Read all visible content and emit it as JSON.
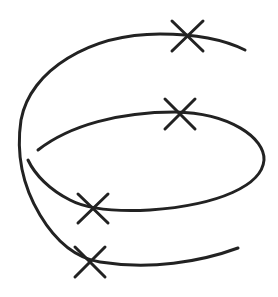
{
  "diagram": {
    "stroke_color": "#222222",
    "background": "#ffffff",
    "markers": [
      {
        "name": "marker-top-outer",
        "x": 187,
        "y": 35
      },
      {
        "name": "marker-top-inner",
        "x": 180,
        "y": 113
      },
      {
        "name": "marker-lower-inner",
        "x": 93,
        "y": 208
      },
      {
        "name": "marker-bottom",
        "x": 90,
        "y": 262
      }
    ]
  }
}
